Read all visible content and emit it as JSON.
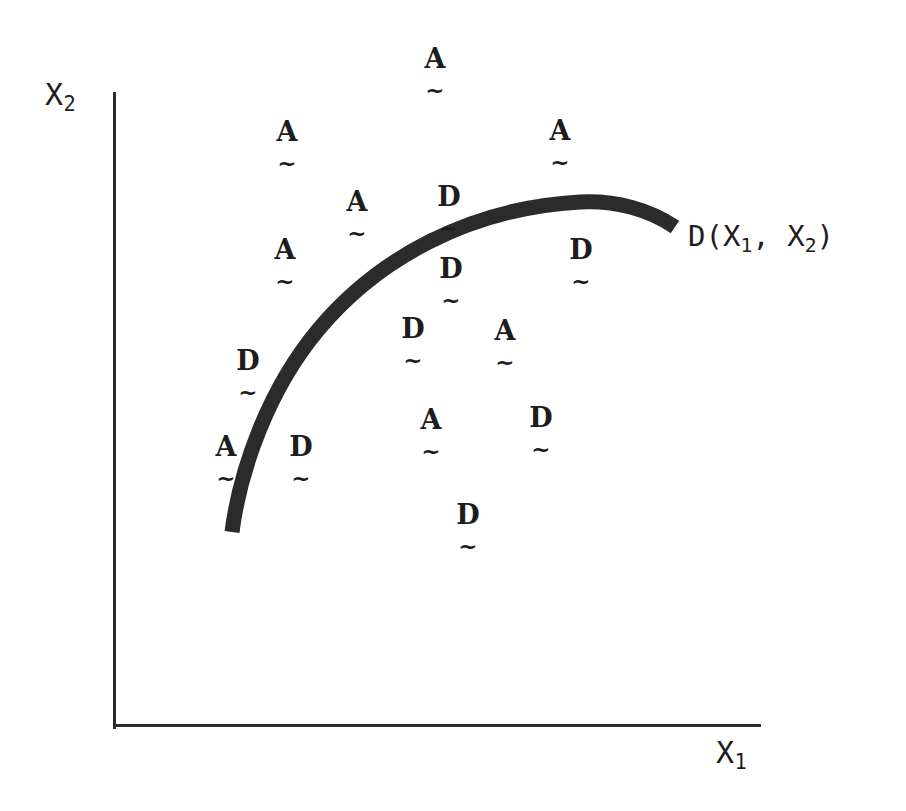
{
  "figure": {
    "background_color": "#ffffff",
    "ink_color": "#2b2b2b",
    "width": 906,
    "height": 811
  },
  "axes": {
    "y_label": "X",
    "y_label_sub": "2",
    "x_label": "X",
    "x_label_sub": "1",
    "y_axis_name": "y-axis-line",
    "x_axis_name": "x-axis-line"
  },
  "curve": {
    "label_prefix": "D(X",
    "label_sub1": "1",
    "label_mid": ", X",
    "label_sub2": "2",
    "label_suffix": ")",
    "full_label": "D(X1, X2)",
    "color": "#2b2b2b",
    "thickness": 15,
    "path": "M 232 532 C 240 470 268 390 318 330 C 378 258 470 208 580 202 C 616 200 650 210 675 227"
  },
  "chart_data": {
    "type": "scatter",
    "title": "",
    "subtitle": "",
    "xlabel": "X1",
    "ylabel": "X2",
    "grid": false,
    "legend": "none",
    "annotations": [
      {
        "text": "D(X1, X2)",
        "x": 688,
        "y": 222,
        "role": "decision-boundary-label"
      }
    ],
    "boundary_curve": {
      "name": "D(X1, X2)",
      "description": "Thick concave decision boundary separating A group (upper left) from D group (lower right)",
      "points": [
        [
          232,
          532
        ],
        [
          260,
          450
        ],
        [
          300,
          368
        ],
        [
          360,
          290
        ],
        [
          440,
          232
        ],
        [
          520,
          208
        ],
        [
          580,
          202
        ],
        [
          630,
          208
        ],
        [
          675,
          227
        ]
      ]
    },
    "groups": [
      "A",
      "D"
    ],
    "points": [
      {
        "label": "A",
        "tilde": "~",
        "x": 418,
        "y": 45
      },
      {
        "label": "A",
        "tilde": "~",
        "x": 270,
        "y": 118
      },
      {
        "label": "A",
        "tilde": "~",
        "x": 543,
        "y": 117
      },
      {
        "label": "A",
        "tilde": "~",
        "x": 340,
        "y": 188
      },
      {
        "label": "D",
        "tilde": "~",
        "x": 432,
        "y": 183
      },
      {
        "label": "A",
        "tilde": "~",
        "x": 268,
        "y": 236
      },
      {
        "label": "D",
        "tilde": "~",
        "x": 564,
        "y": 236
      },
      {
        "label": "D",
        "tilde": "~",
        "x": 434,
        "y": 255
      },
      {
        "label": "D",
        "tilde": "~",
        "x": 396,
        "y": 315
      },
      {
        "label": "A",
        "tilde": "~",
        "x": 488,
        "y": 317
      },
      {
        "label": "D",
        "tilde": "~",
        "x": 231,
        "y": 347
      },
      {
        "label": "A",
        "tilde": "~",
        "x": 209,
        "y": 433
      },
      {
        "label": "D",
        "tilde": "~",
        "x": 284,
        "y": 433
      },
      {
        "label": "A",
        "tilde": "~",
        "x": 414,
        "y": 406
      },
      {
        "label": "D",
        "tilde": "~",
        "x": 524,
        "y": 404
      },
      {
        "label": "D",
        "tilde": "~",
        "x": 451,
        "y": 501
      }
    ]
  }
}
